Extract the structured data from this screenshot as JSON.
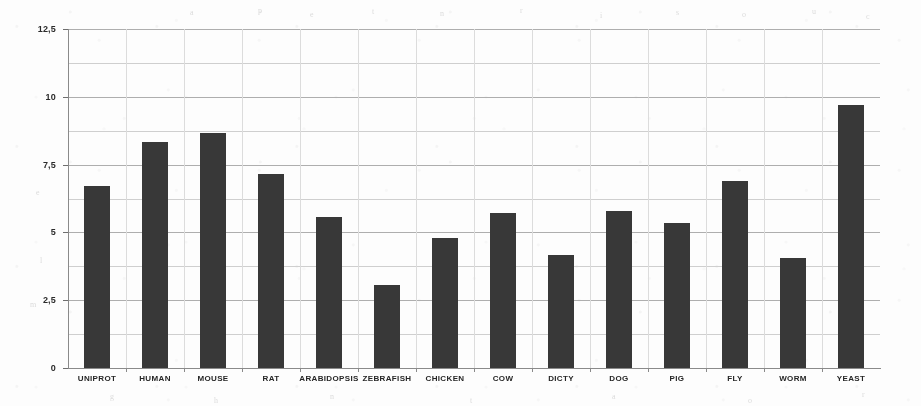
{
  "chart_data": {
    "type": "bar",
    "title": "",
    "subtitle": "",
    "xlabel": "",
    "ylabel": "",
    "categories": [
      "UNIPROT",
      "HUMAN",
      "MOUSE",
      "RAT",
      "ARABIDOPSIS",
      "ZEBRAFISH",
      "CHICKEN",
      "COW",
      "DICTY",
      "DOG",
      "PIG",
      "FLY",
      "WORM",
      "YEAST"
    ],
    "values": [
      6.7,
      8.35,
      8.65,
      7.15,
      5.55,
      3.05,
      4.8,
      5.7,
      4.15,
      5.8,
      5.35,
      6.9,
      4.05,
      9.7
    ],
    "ylim": [
      0,
      12.5
    ],
    "ytick_labels": [
      "0",
      "2,5",
      "5",
      "7,5",
      "10",
      "12,5"
    ],
    "ytick_values": [
      0,
      2.5,
      5,
      7.5,
      10,
      12.5
    ],
    "minor_ytick_values": [
      1.25,
      3.75,
      6.25,
      8.75,
      11.25
    ],
    "grid": true,
    "legend": null,
    "bar_color": "#383838",
    "grid_color": "#aeaeae",
    "axis_color": "#8a8a8a",
    "background_color": "#fdfdfd"
  },
  "ghost_marks": [
    {
      "text": "a",
      "x": 190,
      "y": 8
    },
    {
      "text": "p",
      "x": 258,
      "y": 6
    },
    {
      "text": "e",
      "x": 310,
      "y": 10
    },
    {
      "text": "t",
      "x": 372,
      "y": 7
    },
    {
      "text": "n",
      "x": 440,
      "y": 9
    },
    {
      "text": "r",
      "x": 520,
      "y": 6
    },
    {
      "text": "i",
      "x": 600,
      "y": 11
    },
    {
      "text": "s",
      "x": 676,
      "y": 8
    },
    {
      "text": "o",
      "x": 742,
      "y": 10
    },
    {
      "text": "u",
      "x": 812,
      "y": 7
    },
    {
      "text": "c",
      "x": 866,
      "y": 12
    },
    {
      "text": "e",
      "x": 36,
      "y": 188
    },
    {
      "text": "l",
      "x": 40,
      "y": 256
    },
    {
      "text": "m",
      "x": 30,
      "y": 300
    },
    {
      "text": "g",
      "x": 110,
      "y": 392
    },
    {
      "text": "h",
      "x": 214,
      "y": 396
    },
    {
      "text": "n",
      "x": 330,
      "y": 392
    },
    {
      "text": "t",
      "x": 470,
      "y": 396
    },
    {
      "text": "a",
      "x": 612,
      "y": 392
    },
    {
      "text": "o",
      "x": 748,
      "y": 396
    },
    {
      "text": "r",
      "x": 862,
      "y": 390
    }
  ]
}
